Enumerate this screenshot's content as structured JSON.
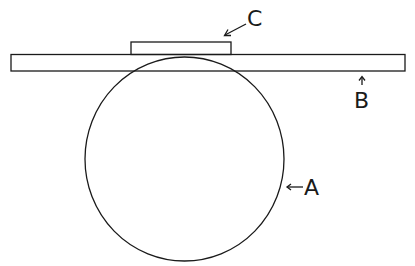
{
  "diagram": {
    "type": "schematic",
    "stroke_color": "#1a1a1a",
    "background": "#ffffff",
    "elements": [
      {
        "id": "A",
        "shape": "circle",
        "label": "A",
        "description": "large circle beneath bar"
      },
      {
        "id": "B",
        "shape": "long-rectangle",
        "label": "B",
        "description": "horizontal bar resting on circle"
      },
      {
        "id": "C",
        "shape": "small-rectangle",
        "label": "C",
        "description": "small block on top of bar"
      }
    ]
  },
  "labels": {
    "a": "A",
    "b": "B",
    "c": "C"
  }
}
